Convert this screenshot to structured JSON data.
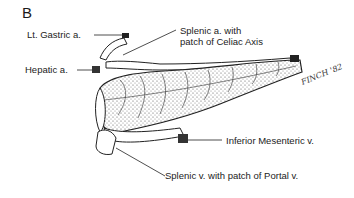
{
  "figure": {
    "panel_label": "B",
    "signature": "FINCH '82"
  },
  "labels": [
    {
      "id": "lt_gastric",
      "text": "Lt. Gastric a."
    },
    {
      "id": "hepatic",
      "text": "Hepatic a."
    },
    {
      "id": "splenic_a_line1",
      "text": "Splenic a. with"
    },
    {
      "id": "splenic_a_line2",
      "text": "patch of Celiac Axis"
    },
    {
      "id": "inferior_mesenteric",
      "text": "Inferior Mesenteric v."
    },
    {
      "id": "splenic_v",
      "text": "Splenic v. with patch of Portal v."
    }
  ]
}
